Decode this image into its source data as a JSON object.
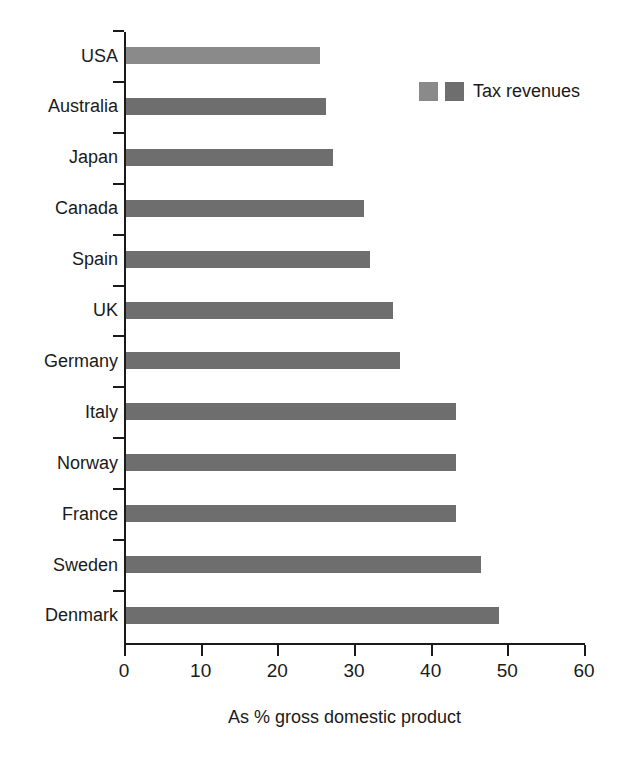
{
  "chart_data": {
    "type": "bar",
    "orientation": "horizontal",
    "title": "",
    "xlabel": "As % gross domestic product",
    "ylabel": "",
    "xlim": [
      0,
      60
    ],
    "xticks": [
      0,
      10,
      20,
      30,
      40,
      50,
      60
    ],
    "grid": false,
    "legend": {
      "position": "top-right",
      "label": "Tax revenues",
      "swatches": [
        "#8a8a8a",
        "#6e6e6e"
      ]
    },
    "categories": [
      "USA",
      "Australia",
      "Japan",
      "Canada",
      "Spain",
      "UK",
      "Germany",
      "Italy",
      "Norway",
      "France",
      "Sweden",
      "Denmark"
    ],
    "values": [
      25.3,
      26.1,
      27.0,
      31.1,
      31.8,
      34.8,
      35.7,
      43.0,
      43.0,
      43.0,
      46.3,
      48.6
    ],
    "colors": [
      "#8a8a8a",
      "#6e6e6e",
      "#6e6e6e",
      "#6e6e6e",
      "#6e6e6e",
      "#6e6e6e",
      "#6e6e6e",
      "#6e6e6e",
      "#6e6e6e",
      "#6e6e6e",
      "#6e6e6e",
      "#6e6e6e"
    ],
    "series": [
      {
        "name": "Tax revenues",
        "values": [
          25.3,
          26.1,
          27.0,
          31.1,
          31.8,
          34.8,
          35.7,
          43.0,
          43.0,
          43.0,
          46.3,
          48.6
        ]
      }
    ]
  }
}
